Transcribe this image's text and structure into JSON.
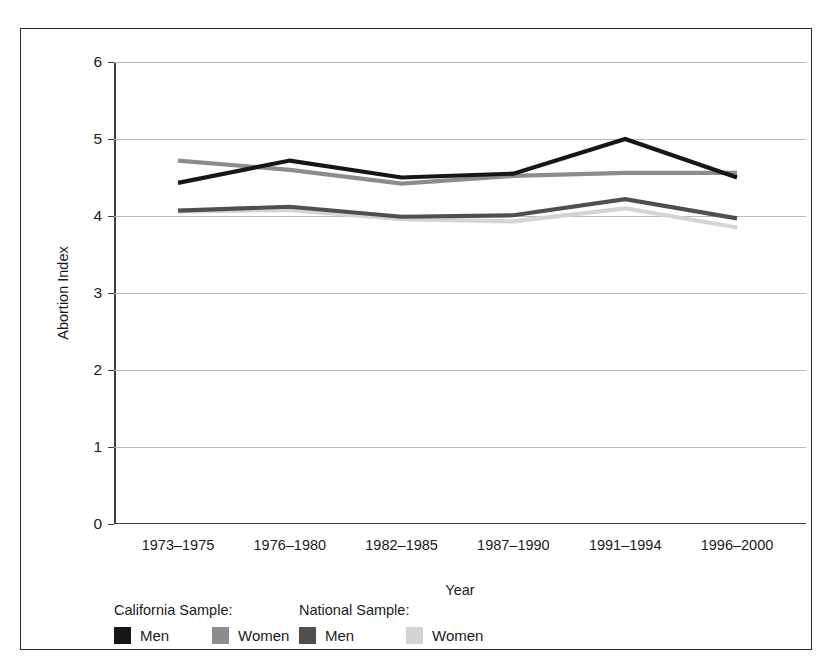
{
  "chart_data": {
    "type": "line",
    "title": "",
    "xlabel": "Year",
    "ylabel": "Abortion Index",
    "categories": [
      "1973–1975",
      "1976–1980",
      "1982–1985",
      "1987–1990",
      "1991–1994",
      "1996–2000"
    ],
    "ylim": [
      0,
      6
    ],
    "yticks": [
      0,
      1,
      2,
      3,
      4,
      5,
      6
    ],
    "grid": true,
    "legend_position": "bottom-left",
    "legend_groups": [
      {
        "header": "California Sample:",
        "entries": [
          "Men",
          "Women"
        ]
      },
      {
        "header": "National Sample:",
        "entries": [
          "Men",
          "Women"
        ]
      }
    ],
    "series": [
      {
        "name": "California Men",
        "group": "California Sample:",
        "label": "Men",
        "color": "#161616",
        "values": [
          4.43,
          4.72,
          4.5,
          4.55,
          5.0,
          4.5
        ]
      },
      {
        "name": "California Women",
        "group": "California Sample:",
        "label": "Women",
        "color": "#8c8c8c",
        "values": [
          4.72,
          4.6,
          4.42,
          4.52,
          4.56,
          4.56
        ]
      },
      {
        "name": "National Men",
        "group": "National Sample:",
        "label": "Men",
        "color": "#4f4f4f",
        "values": [
          4.07,
          4.12,
          3.99,
          4.01,
          4.22,
          3.97
        ]
      },
      {
        "name": "National Women",
        "group": "National Sample:",
        "label": "Women",
        "color": "#d4d4d4",
        "values": [
          4.06,
          4.08,
          3.96,
          3.93,
          4.1,
          3.85
        ]
      }
    ]
  },
  "axis": {
    "ylabel": "Abortion Index",
    "xlabel": "Year"
  }
}
